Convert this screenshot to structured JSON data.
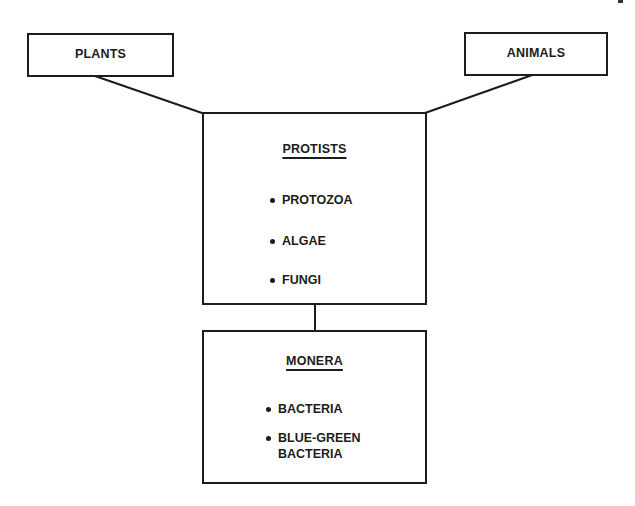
{
  "diagram": {
    "nodes": {
      "plants": {
        "label": "PLANTS"
      },
      "animals": {
        "label": "ANIMALS"
      },
      "protists": {
        "title": "PROTISTS",
        "items": [
          "PROTOZOA",
          "ALGAE",
          "FUNGI"
        ]
      },
      "monera": {
        "title": "MONERA",
        "items": [
          "BACTERIA",
          "BLUE-GREEN",
          "BACTERIA"
        ]
      }
    },
    "edges": [
      {
        "from": "PLANTS",
        "to": "PROTISTS"
      },
      {
        "from": "ANIMALS",
        "to": "PROTISTS"
      },
      {
        "from": "PROTISTS",
        "to": "MONERA"
      }
    ],
    "colors": {
      "stroke": "#1c1c1c",
      "background": "#ffffff"
    }
  }
}
